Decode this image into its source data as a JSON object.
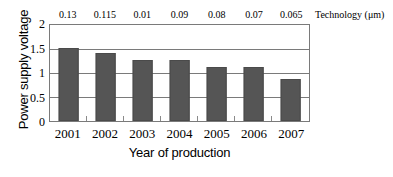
{
  "chart_data": {
    "type": "bar",
    "title": "",
    "categories": [
      "2001",
      "2002",
      "2003",
      "2004",
      "2005",
      "2006",
      "2007"
    ],
    "values": [
      1.52,
      1.41,
      1.28,
      1.28,
      1.13,
      1.13,
      0.88
    ],
    "xlabel": "Year of production",
    "ylabel": "Power supply voltage",
    "ylim": [
      0,
      2
    ],
    "yticks": [
      "0",
      "0.5",
      "1",
      "1.5",
      "2"
    ],
    "ytick_values": [
      0,
      0.5,
      1,
      1.5,
      2
    ],
    "grid": true,
    "legend": "none",
    "secondary_axis": {
      "position": "top",
      "label": "Technology (μm)",
      "ticks": [
        "0.13",
        "0.115",
        "0.01",
        "0.09",
        "0.08",
        "0.07",
        "0.065"
      ],
      "values": [
        0.13,
        0.115,
        0.01,
        0.09,
        0.08,
        0.07,
        0.065
      ]
    },
    "colors": {
      "bar_fill": "#555555",
      "bar_edge": "#4a4a4a",
      "gridline": "#7a7a7a",
      "axis": "#7a7a7a",
      "background": "#ffffff",
      "text": "#000000"
    }
  }
}
